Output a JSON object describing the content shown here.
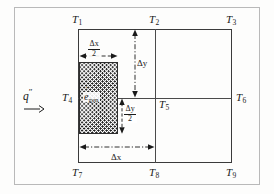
{
  "figure": {
    "type": "finite-difference-nodal-network-diagram",
    "background_color": "#fdfdfc",
    "line_color": "#3b3b3b"
  },
  "nodes": [
    {
      "id": "T1",
      "label": "T",
      "sub": "1"
    },
    {
      "id": "T2",
      "label": "T",
      "sub": "2"
    },
    {
      "id": "T3",
      "label": "T",
      "sub": "3"
    },
    {
      "id": "T4",
      "label": "T",
      "sub": "4"
    },
    {
      "id": "T5",
      "label": "T",
      "sub": "5"
    },
    {
      "id": "T6",
      "label": "T",
      "sub": "6"
    },
    {
      "id": "T7",
      "label": "T",
      "sub": "7"
    },
    {
      "id": "T8",
      "label": "T",
      "sub": "8"
    },
    {
      "id": "T9",
      "label": "T",
      "sub": "9"
    }
  ],
  "heat_flux": {
    "symbol": "q",
    "superscript": "″",
    "arrow_icon": "right-arrow-icon",
    "direction": "right"
  },
  "control_volume": {
    "label_base": "e",
    "label_sub": "gen",
    "dot_accent": true,
    "fill": "stippled",
    "fill_color": "#1c1c1c"
  },
  "dimensions": [
    {
      "id": "dx_half",
      "numerator": "Δx",
      "denominator": "2",
      "orientation": "horizontal"
    },
    {
      "id": "dy",
      "text": "Δy",
      "orientation": "vertical"
    },
    {
      "id": "dy_half",
      "numerator": "Δy",
      "denominator": "2",
      "orientation": "vertical"
    },
    {
      "id": "dx",
      "text": "Δx",
      "orientation": "horizontal"
    }
  ]
}
